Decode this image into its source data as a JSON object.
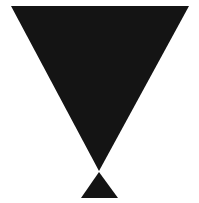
{
  "canvas": {
    "width": "199",
    "height": "203",
    "viewbox": "0 0 199 203",
    "background": "#ffffff"
  },
  "shapes": {
    "large_inverted_triangle": {
      "description": "large solid black triangle pointing downward",
      "points": "11,6 189,6 99,171",
      "fill": "#141414"
    },
    "small_upward_triangle": {
      "description": "small solid black triangle pointing upward, apex nearly touching the large triangle's tip",
      "points": "99,172 118,198 81,198",
      "fill": "#141414"
    }
  }
}
